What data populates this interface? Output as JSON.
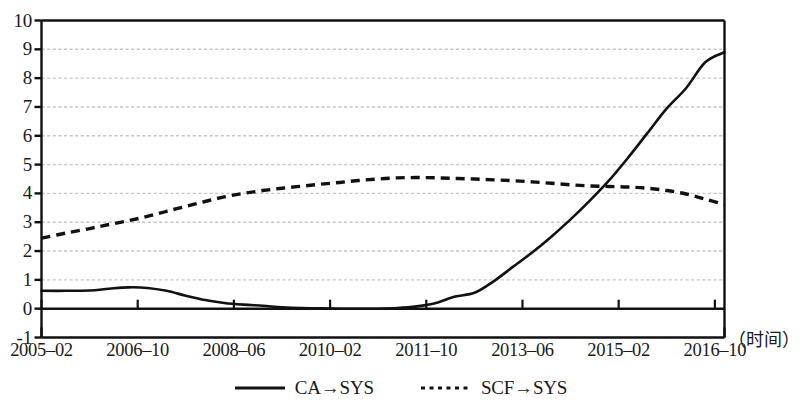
{
  "chart_data": {
    "type": "line",
    "title": "",
    "xlabel": "（时间）",
    "ylabel": "",
    "ylim": [
      -1,
      10
    ],
    "ytick_labels": [
      "10",
      "9",
      "8",
      "7",
      "6",
      "5",
      "4",
      "3",
      "2",
      "1",
      "0",
      "-1"
    ],
    "ytick_values": [
      10,
      9,
      8,
      7,
      6,
      5,
      4,
      3,
      2,
      1,
      0,
      -1
    ],
    "grid": true,
    "grid_style": "dotted",
    "grid_color": "#c8c8c8",
    "legend_position": "bottom-center",
    "x_tick_labels": [
      "2005–02",
      "2006–10",
      "2008–06",
      "2010–02",
      "2011–10",
      "2013–06",
      "2015–02",
      "2016–10"
    ],
    "x_tick_index": [
      0,
      20,
      40,
      60,
      80,
      100,
      120,
      140
    ],
    "x_range_months": [
      0,
      142
    ],
    "series": [
      {
        "name": "CA→SYS",
        "style": "solid",
        "color": "#111111",
        "x": [
          0,
          5,
          10,
          14,
          18,
          22,
          26,
          30,
          34,
          38,
          42,
          46,
          50,
          54,
          58,
          62,
          66,
          70,
          74,
          78,
          82,
          86,
          90,
          94,
          98,
          102,
          106,
          110,
          114,
          118,
          122,
          126,
          130,
          134,
          138,
          142
        ],
        "values": [
          0.62,
          0.62,
          0.63,
          0.69,
          0.74,
          0.72,
          0.62,
          0.45,
          0.3,
          0.2,
          0.14,
          0.1,
          0.05,
          0.02,
          0.01,
          0.0,
          0.0,
          0.0,
          0.02,
          0.08,
          0.2,
          0.42,
          0.55,
          0.95,
          1.45,
          1.95,
          2.5,
          3.1,
          3.75,
          4.45,
          5.25,
          6.1,
          6.95,
          7.65,
          8.55,
          8.9
        ]
      },
      {
        "name": "SCF→SYS",
        "style": "dotted",
        "color": "#111111",
        "x": [
          0,
          5,
          10,
          14,
          18,
          22,
          26,
          30,
          34,
          38,
          42,
          46,
          50,
          54,
          58,
          62,
          66,
          70,
          74,
          78,
          82,
          86,
          90,
          94,
          98,
          102,
          106,
          110,
          114,
          118,
          122,
          126,
          130,
          134,
          138,
          142
        ],
        "values": [
          2.45,
          2.62,
          2.78,
          2.92,
          3.05,
          3.2,
          3.38,
          3.55,
          3.72,
          3.88,
          4.0,
          4.1,
          4.18,
          4.25,
          4.32,
          4.38,
          4.45,
          4.5,
          4.54,
          4.55,
          4.54,
          4.52,
          4.5,
          4.47,
          4.44,
          4.4,
          4.35,
          4.3,
          4.26,
          4.24,
          4.22,
          4.18,
          4.1,
          3.98,
          3.8,
          3.62
        ]
      }
    ]
  },
  "legend": {
    "items": [
      {
        "label": "CA→SYS",
        "style": "solid"
      },
      {
        "label": "SCF→SYS",
        "style": "dotted"
      }
    ]
  }
}
